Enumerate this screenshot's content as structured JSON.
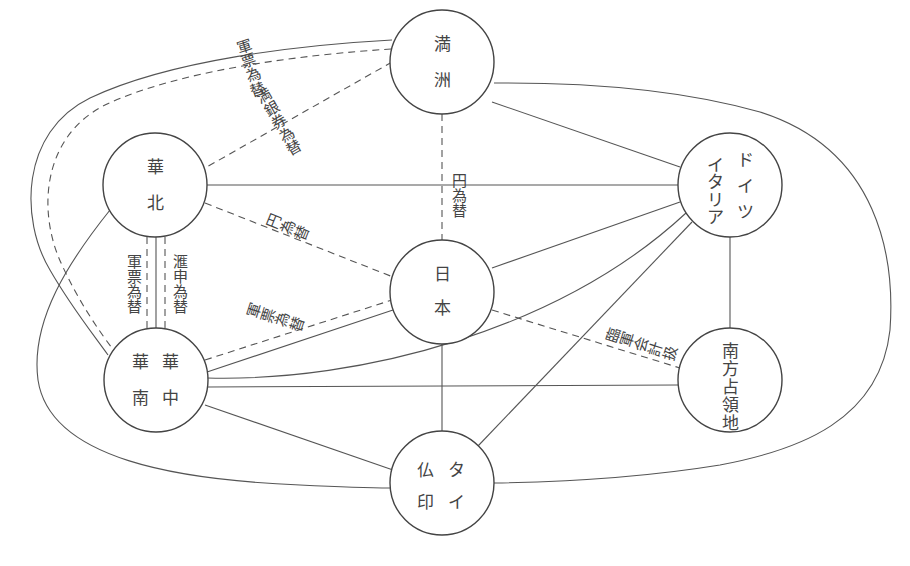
{
  "diagram": {
    "type": "network",
    "nodes": [
      {
        "id": "manshu",
        "label": "満洲",
        "columns": [
          [
            "満",
            "洲"
          ]
        ],
        "cx": 442,
        "cy": 62
      },
      {
        "id": "kahoku",
        "label": "華北",
        "columns": [
          [
            "華",
            "北"
          ]
        ],
        "cx": 155,
        "cy": 185
      },
      {
        "id": "germany-italy",
        "label": "ドイツ イタリア",
        "columns": [
          [
            "ド",
            "イ",
            "ツ"
          ],
          [
            "イ",
            "タ",
            "リ",
            "ア"
          ]
        ],
        "cx": 730,
        "cy": 185
      },
      {
        "id": "nihon",
        "label": "日本",
        "columns": [
          [
            "日",
            "本"
          ]
        ],
        "cx": 442,
        "cy": 292
      },
      {
        "id": "kachu-kanan",
        "label": "華中 華南",
        "columns": [
          [
            "華",
            "中"
          ],
          [
            "華",
            "南"
          ]
        ],
        "cx": 156,
        "cy": 380
      },
      {
        "id": "nanpo",
        "label": "南方占領地",
        "columns": [
          [
            "南",
            "方",
            "占",
            "領",
            "地"
          ]
        ],
        "cx": 730,
        "cy": 380
      },
      {
        "id": "futsuin-thai",
        "label": "仏印 タイ",
        "columns": [
          [
            "タ",
            "イ"
          ],
          [
            "仏",
            "印"
          ]
        ],
        "cx": 442,
        "cy": 483
      }
    ],
    "edge_labels": [
      {
        "id": "gunpyo-kawase-top",
        "text": "軍票為替",
        "between": [
          "manshu",
          "kachu-kanan"
        ],
        "style": "dashed"
      },
      {
        "id": "mangin-ken-kawase",
        "text": "満銀券為替",
        "between": [
          "manshu",
          "kahoku"
        ],
        "style": "dashed"
      },
      {
        "id": "en-kawase-vertical",
        "text": "円為替",
        "between": [
          "manshu",
          "nihon"
        ],
        "style": "dashed"
      },
      {
        "id": "en-kawase-diag",
        "text": "円為替",
        "between": [
          "kahoku",
          "nihon"
        ],
        "style": "dashed"
      },
      {
        "id": "gunpyo-kawase-left",
        "text": "軍票為替",
        "between": [
          "kahoku",
          "kachu-kanan"
        ],
        "style": "dashed"
      },
      {
        "id": "kanshin-kawase",
        "text": "滙申為替",
        "between": [
          "kahoku",
          "kachu-kanan"
        ],
        "style": "dashed"
      },
      {
        "id": "gunpyo-kawase-mid",
        "text": "軍票為替",
        "between": [
          "nihon",
          "kachu-kanan"
        ],
        "style": "dashed"
      },
      {
        "id": "rinji-gun-kaikei",
        "text": "臨軍会計扱",
        "between": [
          "nihon",
          "nanpo"
        ],
        "style": "dashed"
      }
    ]
  }
}
